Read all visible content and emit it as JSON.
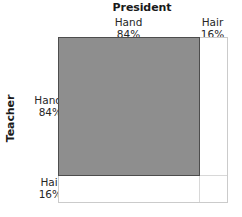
{
  "chart_data": {
    "type": "mosaic",
    "title": "",
    "xlabel": "President",
    "ylabel": "Teacher",
    "x_categories": [
      {
        "name": "Hand",
        "pct": "84%",
        "value": 84
      },
      {
        "name": "Hair",
        "pct": "16%",
        "value": 16
      }
    ],
    "y_categories": [
      {
        "name": "Hand",
        "pct": "84%",
        "value": 84
      },
      {
        "name": "Hair",
        "pct": "16%",
        "value": 16
      }
    ],
    "highlighted_cell": {
      "x": "Hand",
      "y": "Hand"
    },
    "grid": true,
    "legend": "none",
    "colors": {
      "fill": "#8e8e8e",
      "cell_border": "#4d4d4d",
      "frame": "#cbcbcb",
      "grid": "#d8d8d8",
      "text": "#262626",
      "title_text": "#1a1a1a"
    }
  }
}
